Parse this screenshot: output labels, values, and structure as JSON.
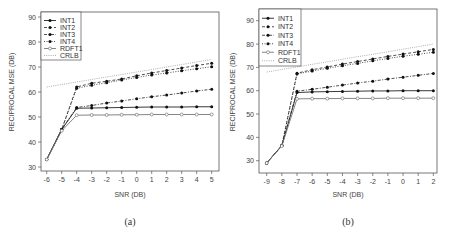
{
  "chart_data": [
    {
      "type": "line",
      "caption": "(a)",
      "title": "",
      "xlabel": "SNR (DB)",
      "ylabel": "RECIPROCAL MSE (DB)",
      "x": [
        -6,
        -5,
        -4,
        -3,
        -2,
        -1,
        0,
        1,
        2,
        3,
        4,
        5
      ],
      "xticks": [
        "-6",
        "-5",
        "-4",
        "-3",
        "-2",
        "-1",
        "0",
        "1",
        "2",
        "3",
        "4",
        "5"
      ],
      "yticks": [
        "30",
        "40",
        "50",
        "60",
        "70",
        "80",
        "90"
      ],
      "xlim": [
        -6,
        5
      ],
      "ylim": [
        30,
        90
      ],
      "grid": false,
      "legend_position": "top-left",
      "series": [
        {
          "name": "INT1",
          "style": "solid",
          "marker": "filled-circle",
          "values": [
            33,
            45,
            53.5,
            53.6,
            53.7,
            53.8,
            53.9,
            54,
            54,
            54,
            54.1,
            54.1
          ]
        },
        {
          "name": "INT2",
          "style": "dashed",
          "marker": "filled-circle",
          "values": [
            33,
            45,
            62,
            63.5,
            64.3,
            65.2,
            66.5,
            67.6,
            68.6,
            69.6,
            70.6,
            71.5
          ]
        },
        {
          "name": "INT3",
          "style": "dashdot",
          "marker": "filled-circle",
          "values": [
            33,
            45,
            53.8,
            54.6,
            55.6,
            56.4,
            57.3,
            58.1,
            58.8,
            59.6,
            60.4,
            61.1
          ]
        },
        {
          "name": "INT4",
          "style": "dotdash",
          "marker": "filled-circle",
          "values": [
            33,
            45,
            61.5,
            62.7,
            63.7,
            64.8,
            65.8,
            66.8,
            67.6,
            68.5,
            69.3,
            70.1
          ]
        },
        {
          "name": "RDFT1",
          "style": "solid-gray",
          "marker": "open-circle",
          "values": [
            33,
            44.5,
            50.7,
            50.8,
            50.8,
            50.9,
            50.9,
            51,
            51,
            51,
            51,
            51
          ]
        },
        {
          "name": "CRLB",
          "style": "dotted",
          "marker": "none",
          "values": [
            62,
            63,
            64,
            65,
            66,
            67,
            68,
            69,
            70,
            71,
            72,
            73
          ]
        }
      ]
    },
    {
      "type": "line",
      "caption": "(b)",
      "title": "",
      "xlabel": "SNR (DB)",
      "ylabel": "RECIPROCAL MSE (DB)",
      "x": [
        -9,
        -8,
        -7,
        -6,
        -5,
        -4,
        -3,
        -2,
        -1,
        0,
        1,
        2
      ],
      "xticks": [
        "-9",
        "-8",
        "-7",
        "-6",
        "-5",
        "-4",
        "-3",
        "-2",
        "-1",
        "0",
        "1",
        "2"
      ],
      "yticks": [
        "30",
        "40",
        "50",
        "60",
        "70",
        "80",
        "90"
      ],
      "xlim": [
        -9,
        2
      ],
      "ylim": [
        30,
        90
      ],
      "grid": false,
      "legend_position": "top-left",
      "series": [
        {
          "name": "INT1",
          "style": "solid",
          "marker": "filled-circle",
          "values": [
            29,
            36.5,
            59.2,
            59.5,
            59.6,
            59.7,
            59.8,
            59.9,
            59.9,
            60,
            60,
            60
          ]
        },
        {
          "name": "INT2",
          "style": "dashed",
          "marker": "filled-circle",
          "values": [
            29,
            36.5,
            67.5,
            69,
            70.2,
            71.4,
            72.5,
            73.6,
            74.7,
            75.7,
            76.7,
            77.7
          ]
        },
        {
          "name": "INT3",
          "style": "dashdot",
          "marker": "filled-circle",
          "values": [
            29,
            36.5,
            59.8,
            60.6,
            61.5,
            62.4,
            63.3,
            64.1,
            65,
            65.8,
            66.6,
            67.4
          ]
        },
        {
          "name": "INT4",
          "style": "dotdash",
          "marker": "filled-circle",
          "values": [
            29,
            36.5,
            67.2,
            68.4,
            69.6,
            70.7,
            71.7,
            72.8,
            73.8,
            74.8,
            75.6,
            76.5
          ]
        },
        {
          "name": "RDFT1",
          "style": "solid-gray",
          "marker": "open-circle",
          "values": [
            29,
            36.3,
            56.5,
            56.6,
            56.6,
            56.7,
            56.7,
            56.7,
            56.8,
            56.8,
            56.8,
            56.8
          ]
        },
        {
          "name": "CRLB",
          "style": "dotted",
          "marker": "none",
          "values": [
            68,
            69.1,
            70.2,
            71.3,
            72.4,
            73.5,
            74.6,
            75.6,
            76.7,
            77.8,
            78.9,
            80
          ]
        }
      ]
    }
  ]
}
